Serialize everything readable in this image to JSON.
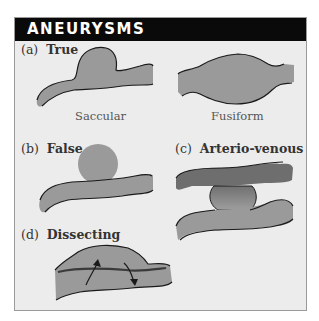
{
  "header": {
    "title": "ANEURYSMS"
  },
  "sections": [
    {
      "id": "a",
      "letter": "(a)",
      "title": "True",
      "subtypes": [
        {
          "caption": "Saccular"
        },
        {
          "caption": "Fusiform"
        }
      ]
    },
    {
      "id": "b",
      "letter": "(b)",
      "title": "False"
    },
    {
      "id": "c",
      "letter": "(c)",
      "title": "Arterio-venous"
    },
    {
      "id": "d",
      "letter": "(d)",
      "title": "Dissecting"
    }
  ],
  "colors": {
    "vessel_fill": "#9a9a9a",
    "vein_fill": "#6e6e6e",
    "outline": "#1a1a1a",
    "panel_bg": "#ececec",
    "header_bg": "#0a0a0a"
  }
}
